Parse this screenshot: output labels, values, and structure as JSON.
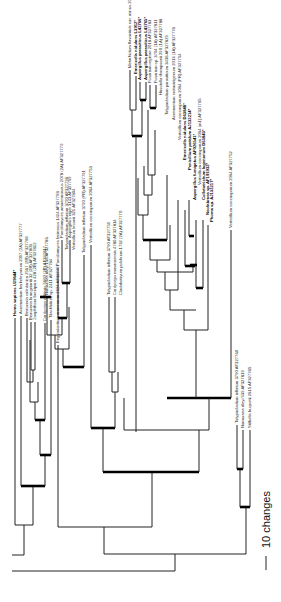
{
  "figure": {
    "type": "phylogenetic-tree",
    "orientation": "rotated-90-ccw",
    "scale_bar": {
      "label": "10 changes"
    }
  },
  "taxa": [
    {
      "id": "homo",
      "label": "Homo sapiens U29644*",
      "bold": true
    },
    {
      "id": "acrem",
      "label": "Acremonium berkeleyanum 2097 (2A) AF327777",
      "bold": false
    },
    {
      "id": "beauv_cal",
      "label": "Beauveria caledonica 2567 (2B) AF327789",
      "bold": false
    },
    {
      "id": "beauv_bron",
      "label": "Beauveria brongniartii 32 (2B) AF327803",
      "bold": false
    },
    {
      "id": "zoophthora",
      "label": "Zoophthora brevipora 428 (2B) AF327812",
      "bold": false
    },
    {
      "id": "cordyceps_mil",
      "label": "Cordyceps militaris 5660 (2B) AF327817",
      "bold": false
    },
    {
      "id": "tilachlidium",
      "label": "Tilachlidium sp. 2411 AF327784",
      "bold": false
    },
    {
      "id": "engyodontium",
      "label": "Engyodontium aranearum 2924 AF327797",
      "bold": false
    },
    {
      "id": "nomuraea_rileyi",
      "label": "Nomuraea rileyi 136 AF327786",
      "bold": false
    },
    {
      "id": "paecilo_farinosus",
      "label": "Paecilomyces farinosus 1424 AF327798",
      "bold": false
    },
    {
      "id": "paecilo_amoeno",
      "label": "Paecilomyces amoenoroseus 2078 (2A) AF327779",
      "bold": false
    },
    {
      "id": "tolypo_inflatum1",
      "label": "Tolypocladium inflatum 3790 AF327796",
      "bold": false
    },
    {
      "id": "aspergillus_niger",
      "label": "Aspergillus niger 3143 AF327799",
      "bold": false
    },
    {
      "id": "verticillium_lecanii",
      "label": "Verticillium lecanii 321 AF327804",
      "bold": false
    },
    {
      "id": "tolypo_inflatum2",
      "label": "Tolypocladium inflatum 3790 (PR) AF327791",
      "bold": false
    },
    {
      "id": "vert_cocco1",
      "label": "Verticillium coccosporum 2064 AF327753",
      "bold": false
    },
    {
      "id": "tolypo_inflatum3",
      "label": "Tolypocladium inflatum 3790 AF327759",
      "bold": false
    },
    {
      "id": "cordyceps_ment",
      "label": "Cordyceps masaraensis 4780 AF327814",
      "bold": false
    },
    {
      "id": "cephalosporium",
      "label": "Cladobotryum pulchrum 1732 (2A) AF327770",
      "bold": false
    },
    {
      "id": "metarhizium",
      "label": "Metarhizium flavoviride var. minus 2037 AF327776",
      "bold": false
    },
    {
      "id": "emericella_nid",
      "label": "Emericella nidulans L3912*",
      "bold": true
    },
    {
      "id": "asp_para1",
      "label": "Aspergillus parasiticus L42766*",
      "bold": true
    },
    {
      "id": "asp_para2",
      "label": "Aspergillus parasiticus L42765*",
      "bold": true
    },
    {
      "id": "fusarium_regina",
      "label": "Fusarium reginae 2018 AF327783",
      "bold": false
    },
    {
      "id": "fusarium_sp",
      "label": "Fusarium sp. 3704 (1A) AF327811",
      "bold": false
    },
    {
      "id": "hirsutella",
      "label": "Hirsutella thompsonii 290 (1A) AF327788",
      "bold": false
    },
    {
      "id": "tolypo_parasiticum",
      "label": "Tolypocladium parasiticum 3436 AF327829",
      "bold": false
    },
    {
      "id": "acremonium_cr",
      "label": "Acremonium crotocinigenum 2013 (1A) AF327778",
      "bold": false
    },
    {
      "id": "vert_cocco2",
      "label": "Verticillium coccosporum 2064 (PR) AF327754",
      "bold": false
    },
    {
      "id": "emericella_nid2",
      "label": "Emericella nidulans D63848*",
      "bold": true
    },
    {
      "id": "penicillium",
      "label": "Penicillium petalum AJ132214*",
      "bold": true
    },
    {
      "id": "asp_fumigatus",
      "label": "Aspergillus fumigatus AF026541*",
      "bold": true
    },
    {
      "id": "vert_cocco3",
      "label": "Verticillium coccosporum 2064 (m1) AF327765",
      "bold": false
    },
    {
      "id": "colletotrichum",
      "label": "Colletotrichum lagenarium D63843*",
      "bold": true
    },
    {
      "id": "neofusicoccum",
      "label": "Neofabraea sp. AF191932*",
      "bold": true
    },
    {
      "id": "phoma",
      "label": "Phoma sp. AJ132217*",
      "bold": true
    },
    {
      "id": "vert_cocco4",
      "label": "Verticillium coccosporum 2064 AF327752",
      "bold": false
    },
    {
      "id": "tolypo_inflatum4",
      "label": "Tolypocladium inflatum 3790 AF327760",
      "bold": false
    },
    {
      "id": "nomuraea_rileyi2",
      "label": "Nomuraea rileyi 539 AF327819",
      "bold": false
    },
    {
      "id": "stilbella",
      "label": "Stilbella buquetii 2615 AF327785",
      "bold": false
    }
  ],
  "colors": {
    "branch": "#222222",
    "thick_branch": "#000000",
    "background": "#ffffff"
  }
}
